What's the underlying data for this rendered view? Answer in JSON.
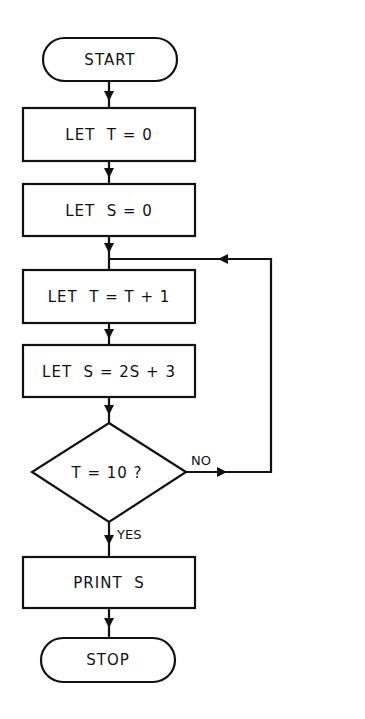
{
  "diagram": {
    "type": "flowchart",
    "nodes": [
      {
        "id": "start",
        "shape": "terminal",
        "label": "START"
      },
      {
        "id": "init_t",
        "shape": "process",
        "label": "LET  T = 0"
      },
      {
        "id": "init_s",
        "shape": "process",
        "label": "LET  S = 0"
      },
      {
        "id": "inc_t",
        "shape": "process",
        "label": "LET  T = T + 1"
      },
      {
        "id": "calc_s",
        "shape": "process",
        "label": "LET  S = 2S + 3"
      },
      {
        "id": "check",
        "shape": "decision",
        "label": "T = 10 ?"
      },
      {
        "id": "print",
        "shape": "process",
        "label": "PRINT  S"
      },
      {
        "id": "stop",
        "shape": "terminal",
        "label": "STOP"
      }
    ],
    "edges": [
      {
        "from": "start",
        "to": "init_t",
        "label": ""
      },
      {
        "from": "init_t",
        "to": "init_s",
        "label": ""
      },
      {
        "from": "init_s",
        "to": "inc_t",
        "label": ""
      },
      {
        "from": "inc_t",
        "to": "calc_s",
        "label": ""
      },
      {
        "from": "calc_s",
        "to": "check",
        "label": ""
      },
      {
        "from": "check",
        "to": "inc_t",
        "label": "NO"
      },
      {
        "from": "check",
        "to": "print",
        "label": "YES"
      },
      {
        "from": "print",
        "to": "stop",
        "label": ""
      }
    ],
    "colors": {
      "stroke": "#111111",
      "background": "#ffffff"
    }
  }
}
